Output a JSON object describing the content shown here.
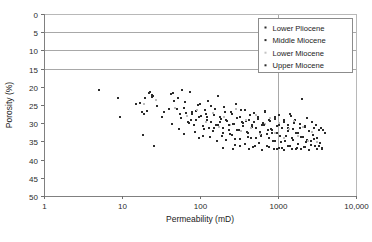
{
  "chart_data": {
    "type": "scatter",
    "title": "",
    "xlabel": "Permeability (mD)",
    "ylabel": "Porosity (%)",
    "xscale": "log",
    "xlim": [
      1,
      10000
    ],
    "ylim": [
      0,
      50
    ],
    "y_inverted": true,
    "xticklabels": [
      "1",
      "10",
      "100",
      "1000",
      "10,000"
    ],
    "xtickvalues": [
      1,
      10,
      100,
      1000,
      10000
    ],
    "yticklabels": [
      "0",
      "5",
      "10",
      "15",
      "20",
      "25",
      "30",
      "35",
      "40",
      "45",
      "50"
    ],
    "ytickvalues": [
      0,
      5,
      10,
      15,
      20,
      25,
      30,
      35,
      40,
      45,
      50
    ],
    "grid": "horizontal gridlines at 0,5,10,15 and vertical gridline at 1000",
    "gridlines_y": [
      0,
      5,
      10,
      15
    ],
    "gridlines_x": [
      1000
    ],
    "legend_position": "top-right",
    "marker": "square",
    "marker_size_px": 2,
    "series": [
      {
        "name": "Lower Pliocene",
        "color": "#2b2b2b",
        "points": [
          [
            5.0,
            21.0
          ],
          [
            9.0,
            23.2
          ],
          [
            9.3,
            28.2
          ],
          [
            15.0,
            24.6
          ],
          [
            17.0,
            24.4
          ],
          [
            18.0,
            26.8
          ],
          [
            19.0,
            27.6
          ],
          [
            18.5,
            33.2
          ],
          [
            21.0,
            26.6
          ],
          [
            23.0,
            21.4
          ],
          [
            24.0,
            22.2
          ],
          [
            25.0,
            22.4
          ],
          [
            26.0,
            36.4
          ],
          [
            33.0,
            28.4
          ],
          [
            40.0,
            26.2
          ],
          [
            45.0,
            21.6
          ],
          [
            47.0,
            24.0
          ],
          [
            52.0,
            23.2
          ],
          [
            55.0,
            27.4
          ],
          [
            58.0,
            20.8
          ],
          [
            62.0,
            25.8
          ],
          [
            66.0,
            27.2
          ],
          [
            70.0,
            29.8
          ],
          [
            74.0,
            21.4
          ],
          [
            78.0,
            27.6
          ],
          [
            84.0,
            30.4
          ],
          [
            90.0,
            26.6
          ],
          [
            96.0,
            28.4
          ],
          [
            100.0,
            24.6
          ],
          [
            108.0,
            33.4
          ],
          [
            115.0,
            26.4
          ],
          [
            122.0,
            29.2
          ],
          [
            130.0,
            31.4
          ],
          [
            140.0,
            25.2
          ],
          [
            150.0,
            27.8
          ],
          [
            160.0,
            30.6
          ],
          [
            172.0,
            22.4
          ],
          [
            185.0,
            28.8
          ],
          [
            198.0,
            31.2
          ],
          [
            210.0,
            26.8
          ],
          [
            225.0,
            29.4
          ],
          [
            240.0,
            33.0
          ],
          [
            255.0,
            27.6
          ],
          [
            270.0,
            30.2
          ],
          [
            290.0,
            24.8
          ],
          [
            310.0,
            31.8
          ],
          [
            330.0,
            28.2
          ],
          [
            350.0,
            29.8
          ],
          [
            375.0,
            26.4
          ],
          [
            400.0,
            32.4
          ],
          [
            430.0,
            29.0
          ],
          [
            460.0,
            30.6
          ],
          [
            490.0,
            27.2
          ],
          [
            520.0,
            31.4
          ],
          [
            560.0,
            28.8
          ],
          [
            600.0,
            33.2
          ],
          [
            640.0,
            30.0
          ],
          [
            690.0,
            26.6
          ],
          [
            740.0,
            31.8
          ],
          [
            790.0,
            29.4
          ],
          [
            850.0,
            32.6
          ],
          [
            910.0,
            28.4
          ],
          [
            970.0,
            30.8
          ],
          [
            1040.0,
            27.8
          ],
          [
            1110.0,
            31.2
          ],
          [
            1190.0,
            29.6
          ],
          [
            1270.0,
            33.4
          ],
          [
            1360.0,
            30.4
          ],
          [
            1460.0,
            28.0
          ],
          [
            1560.0,
            31.6
          ],
          [
            1670.0,
            29.2
          ],
          [
            1790.0,
            32.8
          ],
          [
            1920.0,
            30.2
          ],
          [
            2050.0,
            23.4
          ],
          [
            2200.0,
            31.0
          ],
          [
            2350.0,
            28.6
          ],
          [
            2520.0,
            32.2
          ],
          [
            2700.0,
            29.8
          ],
          [
            2890.0,
            31.4
          ],
          [
            3100.0,
            30.6
          ],
          [
            3320.0,
            32.0
          ],
          [
            3550.0,
            31.2
          ],
          [
            3800.0,
            31.8
          ],
          [
            4050.0,
            32.6
          ]
        ]
      },
      {
        "name": "Middle Miocene",
        "color": "#2b2b2b",
        "points": [
          [
            20.0,
            23.0
          ],
          [
            22.0,
            21.8
          ],
          [
            24.0,
            22.8
          ],
          [
            28.0,
            25.4
          ],
          [
            35.0,
            27.0
          ],
          [
            43.0,
            22.0
          ],
          [
            50.0,
            26.0
          ],
          [
            57.0,
            28.6
          ],
          [
            64.0,
            24.2
          ],
          [
            72.0,
            30.0
          ],
          [
            80.0,
            26.8
          ],
          [
            88.0,
            29.2
          ],
          [
            95.0,
            25.0
          ],
          [
            104.0,
            28.0
          ],
          [
            112.0,
            31.6
          ],
          [
            120.0,
            27.4
          ],
          [
            128.0,
            23.8
          ],
          [
            138.0,
            29.6
          ],
          [
            148.0,
            32.2
          ],
          [
            158.0,
            26.2
          ],
          [
            168.0,
            30.4
          ],
          [
            180.0,
            28.2
          ],
          [
            192.0,
            33.6
          ],
          [
            205.0,
            25.6
          ],
          [
            218.0,
            29.0
          ],
          [
            232.0,
            31.8
          ],
          [
            248.0,
            27.0
          ],
          [
            264.0,
            30.2
          ],
          [
            280.0,
            34.4
          ],
          [
            298.0,
            28.6
          ],
          [
            318.0,
            32.0
          ],
          [
            338.0,
            26.4
          ],
          [
            360.0,
            30.8
          ],
          [
            384.0,
            29.4
          ],
          [
            408.0,
            33.8
          ],
          [
            434.0,
            27.8
          ],
          [
            462.0,
            31.0
          ],
          [
            492.0,
            29.8
          ],
          [
            524.0,
            34.2
          ],
          [
            558.0,
            28.4
          ],
          [
            594.0,
            32.4
          ],
          [
            632.0,
            30.6
          ],
          [
            672.0,
            26.8
          ],
          [
            716.0,
            33.0
          ],
          [
            762.0,
            29.2
          ],
          [
            810.0,
            31.6
          ],
          [
            862.0,
            34.8
          ],
          [
            918.0,
            28.8
          ],
          [
            976.0,
            32.8
          ],
          [
            1040.0,
            30.4
          ],
          [
            1106.0,
            35.2
          ],
          [
            1178.0,
            29.0
          ],
          [
            1254.0,
            33.4
          ],
          [
            1334.0,
            31.2
          ],
          [
            1420.0,
            27.6
          ],
          [
            1512.0,
            34.0
          ],
          [
            1610.0,
            30.0
          ],
          [
            1714.0,
            32.6
          ],
          [
            1824.0,
            35.6
          ],
          [
            1942.0,
            31.4
          ],
          [
            2067.0,
            33.8
          ],
          [
            2200.0,
            30.8
          ],
          [
            2342.0,
            34.6
          ],
          [
            2493.0,
            32.2
          ],
          [
            2654.0,
            35.0
          ],
          [
            2825.0,
            33.2
          ],
          [
            3007.0,
            36.2
          ],
          [
            3201.0,
            34.0
          ],
          [
            3408.0,
            35.4
          ],
          [
            3627.0,
            36.8
          ]
        ]
      },
      {
        "name": "Lower Miocene",
        "color": "#bcbcbc",
        "points": [
          [
            19.0,
            24.8
          ],
          [
            27.0,
            23.6
          ],
          [
            48.0,
            25.8
          ],
          [
            68.0,
            28.0
          ],
          [
            92.0,
            26.4
          ],
          [
            118.0,
            29.8
          ],
          [
            145.0,
            27.2
          ],
          [
            175.0,
            31.0
          ],
          [
            206.0,
            28.4
          ],
          [
            244.0,
            30.6
          ],
          [
            286.0,
            26.0
          ],
          [
            332.0,
            32.2
          ],
          [
            386.0,
            29.2
          ],
          [
            448.0,
            31.4
          ],
          [
            516.0,
            27.8
          ],
          [
            596.0,
            33.0
          ],
          [
            686.0,
            30.2
          ],
          [
            790.0,
            28.6
          ],
          [
            908.0,
            32.8
          ],
          [
            1044.0,
            30.0
          ],
          [
            1200.0,
            34.0
          ],
          [
            1380.0,
            31.6
          ],
          [
            1586.0,
            29.4
          ],
          [
            1822.0,
            33.6
          ],
          [
            2094.0,
            31.0
          ],
          [
            2406.0,
            34.8
          ],
          [
            2766.0,
            32.4
          ],
          [
            3178.0,
            35.2
          ]
        ]
      },
      {
        "name": "Upper Miocene",
        "color": "#2b2b2b",
        "points": [
          [
            44.0,
            30.2
          ],
          [
            54.0,
            31.6
          ],
          [
            63.0,
            33.0
          ],
          [
            76.0,
            29.0
          ],
          [
            86.0,
            32.4
          ],
          [
            98.0,
            34.2
          ],
          [
            110.0,
            30.8
          ],
          [
            124.0,
            28.2
          ],
          [
            136.0,
            33.8
          ],
          [
            152.0,
            31.2
          ],
          [
            166.0,
            35.0
          ],
          [
            182.0,
            29.6
          ],
          [
            200.0,
            32.8
          ],
          [
            216.0,
            34.6
          ],
          [
            236.0,
            30.4
          ],
          [
            256.0,
            33.2
          ],
          [
            278.0,
            36.0
          ],
          [
            302.0,
            31.8
          ],
          [
            326.0,
            34.4
          ],
          [
            354.0,
            30.0
          ],
          [
            382.0,
            35.8
          ],
          [
            414.0,
            32.6
          ],
          [
            448.0,
            34.0
          ],
          [
            484.0,
            36.6
          ],
          [
            524.0,
            31.4
          ],
          [
            566.0,
            35.4
          ],
          [
            612.0,
            33.6
          ],
          [
            662.0,
            30.6
          ],
          [
            716.0,
            36.4
          ],
          [
            774.0,
            34.2
          ],
          [
            836.0,
            32.0
          ],
          [
            904.0,
            35.0
          ],
          [
            978.0,
            37.0
          ],
          [
            1056.0,
            33.4
          ],
          [
            1142.0,
            36.8
          ],
          [
            1234.0,
            34.8
          ],
          [
            1334.0,
            32.2
          ],
          [
            1442.0,
            36.2
          ],
          [
            1558.0,
            34.6
          ],
          [
            1684.0,
            37.2
          ],
          [
            1820.0,
            35.6
          ],
          [
            1968.0,
            33.8
          ],
          [
            2126.0,
            36.6
          ],
          [
            2298.0,
            35.2
          ],
          [
            2484.0,
            37.4
          ],
          [
            2684.0,
            36.0
          ],
          [
            2902.0,
            34.4
          ],
          [
            3136.0,
            37.0
          ],
          [
            3390.0,
            36.4
          ],
          [
            3664.0,
            37.2
          ],
          [
            200.0,
            36.8
          ],
          [
            265.0,
            37.2
          ],
          [
            330.0,
            36.4
          ],
          [
            420.0,
            37.0
          ],
          [
            500.0,
            36.2
          ],
          [
            630.0,
            37.4
          ],
          [
            760.0,
            36.6
          ],
          [
            890.0,
            37.2
          ],
          [
            1020.0,
            36.8
          ],
          [
            1180.0,
            37.4
          ],
          [
            1340.0,
            36.2
          ],
          [
            1520.0,
            37.0
          ],
          [
            1740.0,
            36.8
          ],
          [
            1980.0,
            37.2
          ],
          [
            2250.0,
            36.6
          ]
        ]
      }
    ]
  },
  "legend": {
    "entries": [
      {
        "label": "Lower  Pliocene",
        "color": "#2b2b2b"
      },
      {
        "label": "Middle Miocene",
        "color": "#2b2b2b"
      },
      {
        "label": "Lower  Miocene",
        "color": "#c4c4c4"
      },
      {
        "label": "Upper Miocene",
        "color": "#2b2b2b"
      }
    ]
  }
}
